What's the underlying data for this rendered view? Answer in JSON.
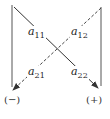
{
  "diagram": {
    "type": "determinant-2x2-rule",
    "elements": [
      {
        "id": "a11",
        "base": "a",
        "sub": "11"
      },
      {
        "id": "a12",
        "base": "a",
        "sub": "12"
      },
      {
        "id": "a21",
        "base": "a",
        "sub": "21"
      },
      {
        "id": "a22",
        "base": "a",
        "sub": "22"
      }
    ],
    "diagonals": [
      {
        "name": "main-diagonal",
        "style": "solid",
        "from": "a11",
        "to": "a22",
        "sign": "(+)"
      },
      {
        "name": "anti-diagonal",
        "style": "dashed",
        "from": "a12",
        "to": "a21",
        "sign": "(−)"
      }
    ],
    "signs": {
      "left": "(−)",
      "right": "(+)"
    },
    "colors": {
      "stroke": "#333333",
      "text": "#222222",
      "background": "#ffffff"
    }
  }
}
